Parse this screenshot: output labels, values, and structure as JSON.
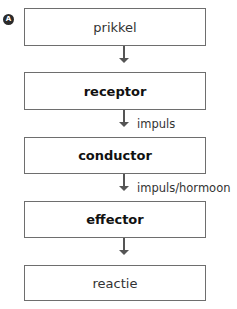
{
  "marker": {
    "label": "A"
  },
  "diagram": {
    "type": "flowchart",
    "direction": "top-to-bottom",
    "nodes": [
      {
        "id": "prikkel",
        "label": "prikkel",
        "bold": false
      },
      {
        "id": "receptor",
        "label": "receptor",
        "bold": true
      },
      {
        "id": "conductor",
        "label": "conductor",
        "bold": true
      },
      {
        "id": "effector",
        "label": "effector",
        "bold": true
      },
      {
        "id": "reactie",
        "label": "reactie",
        "bold": false
      }
    ],
    "edges": [
      {
        "from": "prikkel",
        "to": "receptor",
        "label": ""
      },
      {
        "from": "receptor",
        "to": "conductor",
        "label": "impuls"
      },
      {
        "from": "conductor",
        "to": "effector",
        "label": "impuls/hormoon"
      },
      {
        "from": "effector",
        "to": "reactie",
        "label": ""
      }
    ]
  },
  "colors": {
    "box_border": "#6e6e6e",
    "arrow": "#555555",
    "text": "#1a1a1a"
  }
}
